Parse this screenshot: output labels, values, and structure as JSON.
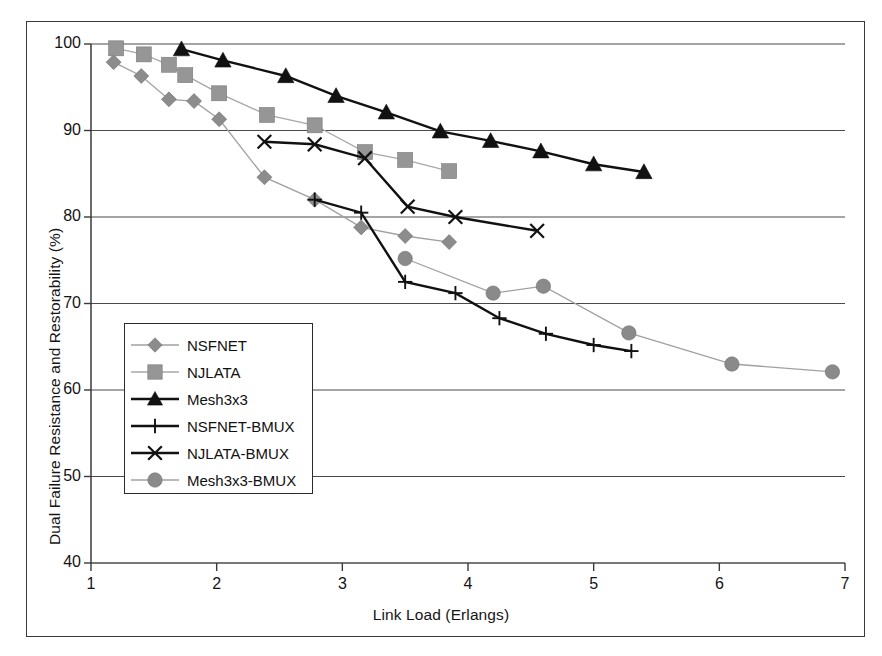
{
  "chart_data": {
    "type": "line",
    "title": "",
    "xlabel": "Link Load (Erlangs)",
    "ylabel": "Dual Failure Resistance and Restorability (%)",
    "xlim": [
      1,
      7
    ],
    "ylim": [
      40,
      100
    ],
    "xticks": [
      1,
      2,
      3,
      4,
      5,
      6,
      7
    ],
    "yticks": [
      40,
      50,
      60,
      70,
      80,
      90,
      100
    ],
    "grid": "horizontal",
    "legend_position": "lower-left-inside",
    "series": [
      {
        "name": "NSFNET",
        "marker": "diamond",
        "color": "#8c8c8c",
        "line_color": "#a0a0a0",
        "x": [
          1.18,
          1.4,
          1.62,
          1.82,
          2.02,
          2.38,
          2.78,
          3.15,
          3.5,
          3.85
        ],
        "y": [
          97.9,
          96.3,
          93.6,
          93.4,
          91.3,
          84.6,
          82.0,
          78.8,
          77.8,
          77.1
        ]
      },
      {
        "name": "NJLATA",
        "marker": "square",
        "color": "#969696",
        "line_color": "#a8a8a8",
        "x": [
          1.2,
          1.42,
          1.62,
          1.75,
          2.02,
          2.4,
          2.78,
          3.18,
          3.5,
          3.85
        ],
        "y": [
          99.5,
          98.8,
          97.6,
          96.4,
          94.3,
          91.8,
          90.6,
          87.5,
          86.6,
          85.3
        ]
      },
      {
        "name": "Mesh3x3",
        "marker": "triangle",
        "color": "#111111",
        "line_color": "#111111",
        "x": [
          1.72,
          2.05,
          2.55,
          2.95,
          3.35,
          3.78,
          4.18,
          4.58,
          5.0,
          5.4
        ],
        "y": [
          99.4,
          98.1,
          96.3,
          94.0,
          92.1,
          89.9,
          88.8,
          87.6,
          86.1,
          85.2
        ]
      },
      {
        "name": "NSFNET-BMUX",
        "marker": "plus",
        "color": "#111111",
        "line_color": "#111111",
        "x": [
          2.78,
          3.15,
          3.5,
          3.9,
          4.25,
          4.62,
          5.0,
          5.3
        ],
        "y": [
          82.0,
          80.5,
          72.5,
          71.2,
          68.3,
          66.5,
          65.2,
          64.5
        ]
      },
      {
        "name": "NJLATA-BMUX",
        "marker": "cross",
        "color": "#111111",
        "line_color": "#111111",
        "x": [
          2.38,
          2.78,
          3.18,
          3.52,
          3.9,
          4.55
        ],
        "y": [
          88.7,
          88.4,
          86.8,
          81.2,
          80.0,
          78.4
        ]
      },
      {
        "name": "Mesh3x3-BMUX",
        "marker": "circle",
        "color": "#8a8a8a",
        "line_color": "#a0a0a0",
        "x": [
          3.5,
          4.2,
          4.6,
          5.28,
          6.1,
          6.9
        ],
        "y": [
          75.2,
          71.2,
          72.0,
          66.6,
          63.0,
          62.1
        ]
      }
    ]
  },
  "legend": {
    "items": [
      {
        "label": "NSFNET",
        "marker": "diamond"
      },
      {
        "label": "NJLATA",
        "marker": "square"
      },
      {
        "label": "Mesh3x3",
        "marker": "triangle"
      },
      {
        "label": "NSFNET-BMUX",
        "marker": "plus"
      },
      {
        "label": "NJLATA-BMUX",
        "marker": "cross"
      },
      {
        "label": "Mesh3x3-BMUX",
        "marker": "circle"
      }
    ]
  },
  "axes": {
    "x_title": "Link Load (Erlangs)",
    "y_title": "Dual Failure Resistance and Restorability (%)",
    "x_tick_labels": [
      "1",
      "2",
      "3",
      "4",
      "5",
      "6",
      "7"
    ],
    "y_tick_labels": [
      "40",
      "50",
      "60",
      "70",
      "80",
      "90",
      "100"
    ]
  },
  "colors": {
    "gray_series": "#8c8c8c",
    "black_series": "#111111",
    "grid": "#4a4a4a",
    "frame": "#3a3a3a"
  }
}
